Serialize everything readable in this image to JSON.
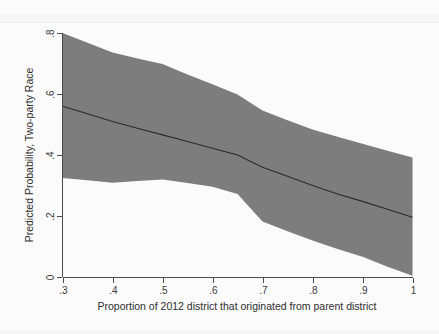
{
  "figure": {
    "background_color": "#fbfbfb",
    "band_color": "#7d7d7d",
    "line_color": "#2b2b2b",
    "axis_color": "#4a4a4a"
  },
  "chart_data": {
    "type": "area",
    "title": "",
    "subtitle": "",
    "xlabel": "Proportion of  2012 district that originated from parent district",
    "ylabel": "Predicted Probability, Two-party Race",
    "xlim": [
      0.3,
      1.0
    ],
    "ylim": [
      0.0,
      0.8
    ],
    "grid": false,
    "legend": "none",
    "xticks": [
      0.3,
      0.4,
      0.5,
      0.6,
      0.7,
      0.8,
      0.9,
      1.0
    ],
    "xticklabels": [
      ".3",
      ".4",
      ".5",
      ".6",
      ".7",
      ".8",
      ".9",
      "1"
    ],
    "yticks": [
      0,
      0.2,
      0.4,
      0.6,
      0.8
    ],
    "yticklabels": [
      "0",
      ".2",
      ".4",
      ".6",
      ".8"
    ],
    "x": [
      0.3,
      0.35,
      0.4,
      0.45,
      0.5,
      0.55,
      0.6,
      0.65,
      0.7,
      0.75,
      0.8,
      0.85,
      0.9,
      0.95,
      1.0
    ],
    "series": [
      {
        "name": "Predicted probability (fit)",
        "role": "line",
        "values": [
          0.56,
          0.535,
          0.51,
          0.488,
          0.466,
          0.444,
          0.422,
          0.4,
          0.36,
          0.33,
          0.3,
          0.272,
          0.248,
          0.222,
          0.196
        ]
      },
      {
        "name": "95% confidence interval, upper bound",
        "role": "ci_upper",
        "values": [
          0.8,
          0.768,
          0.736,
          0.716,
          0.698,
          0.664,
          0.632,
          0.598,
          0.546,
          0.514,
          0.484,
          0.46,
          0.437,
          0.414,
          0.392
        ]
      },
      {
        "name": "95% confidence interval, lower bound",
        "role": "ci_lower",
        "values": [
          0.325,
          0.317,
          0.309,
          0.315,
          0.32,
          0.308,
          0.296,
          0.272,
          0.182,
          0.15,
          0.12,
          0.092,
          0.066,
          0.034,
          0.004
        ]
      }
    ]
  }
}
